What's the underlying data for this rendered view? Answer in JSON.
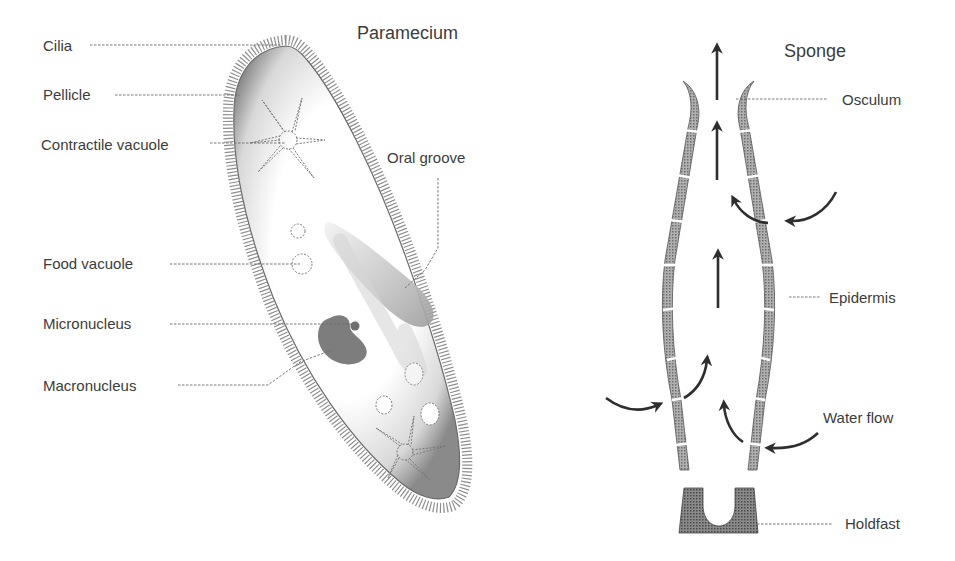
{
  "paramecium": {
    "title": "Paramecium",
    "labels": {
      "cilia": "Cilia",
      "pellicle": "Pellicle",
      "contractile_vacuole": "Contractile vacuole",
      "oral_groove": "Oral groove",
      "food_vacuole": "Food vacuole",
      "micronucleus": "Micronucleus",
      "macronucleus": "Macronucleus"
    }
  },
  "sponge": {
    "title": "Sponge",
    "labels": {
      "osculum": "Osculum",
      "epidermis": "Epidermis",
      "water_flow": "Water flow",
      "holdfast": "Holdfast"
    }
  },
  "colors": {
    "ink": "#3c3c3c",
    "body_shade": "#9a9a9a",
    "nucleus": "#7a7a7a",
    "wall": "#8c8c8c",
    "arrow": "#2e2e2e"
  }
}
